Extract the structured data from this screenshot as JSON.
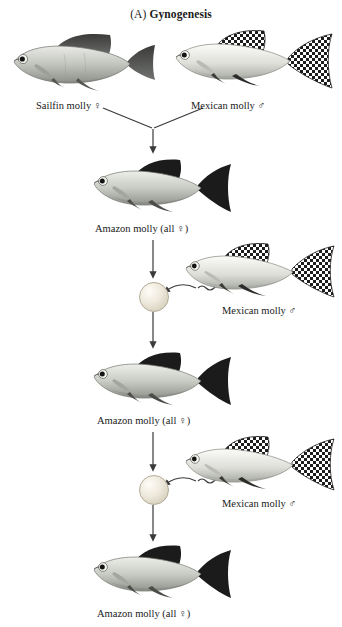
{
  "figure": {
    "panel_tag": "(A)",
    "panel_title": "Gynogenesis"
  },
  "labels": {
    "sailfin_molly_female": "Sailfin molly ♀",
    "mexican_molly_male_1": "Mexican molly ♂",
    "amazon_molly_all_female_1": "Amazon molly  (all ♀)",
    "mexican_molly_male_2": "Mexican molly ♂",
    "amazon_molly_all_female_2": "Amazon molly (all ♀)",
    "mexican_molly_male_3": "Mexican molly ♂",
    "amazon_molly_all_female_3": "Amazon molly (all ♀)"
  },
  "symbols": {
    "female": "♀",
    "male": "♂"
  },
  "colors": {
    "background": "#ffffff",
    "text": "#1a1a1a",
    "arrow": "#3a3a3a",
    "fish_body_light": "#cfd0cb",
    "fish_body_shadow": "#8f918c",
    "fish_fin_dark": "#232323",
    "egg_fill": "#efeade"
  },
  "elements": {
    "egg_1": "egg-cell",
    "egg_2": "egg-cell",
    "sperm_1": "sperm-squiggle",
    "sperm_2": "sperm-squiggle"
  }
}
